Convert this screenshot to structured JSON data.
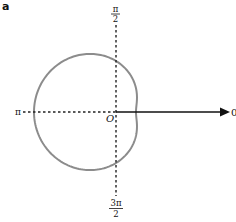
{
  "panel": {
    "label": "a"
  },
  "axes": {
    "origin_label": "O",
    "angle_labels": {
      "zero": "0",
      "half_pi_numerator": "π",
      "half_pi_denominator": "2",
      "pi": "π",
      "three_half_pi_numerator": "3π",
      "three_half_pi_denominator": "2"
    },
    "polar_axis_color": "#111111",
    "dotted_axis_color": "#222222"
  },
  "curve": {
    "type": "limacon",
    "equation": "r = a - b·cos(θ)",
    "a": 51,
    "b": 31,
    "color": "#8c8c8c",
    "stroke_width": 2
  },
  "layout": {
    "origin_px": [
      116,
      112
    ],
    "arrow_end_x": 230,
    "horizontal_dash_start_x": 23,
    "vertical_dash_top_y": 25,
    "vertical_dash_bottom_y": 196
  }
}
